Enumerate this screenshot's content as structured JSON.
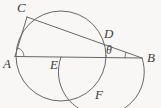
{
  "figure": {
    "type": "geometry-diagram",
    "background_color": "#f8f7f5",
    "ink_color": "#676767",
    "label_color": "#3e3e3e",
    "labels": {
      "A": "A",
      "B": "B",
      "C": "C",
      "D": "D",
      "E": "E",
      "F": "F",
      "theta": "θ"
    },
    "elements": {
      "main_circle": "circle through A, C, D, F",
      "line_ab": "line from A through E to B",
      "line_ac": "chord from A to C",
      "secant_cb": "line from C through D to B",
      "arc_efb": "arc from E through F to B",
      "angle_at_a": "small angle mark at A between AC and AB",
      "angle_theta": "angle θ at B between BD and BA"
    }
  }
}
